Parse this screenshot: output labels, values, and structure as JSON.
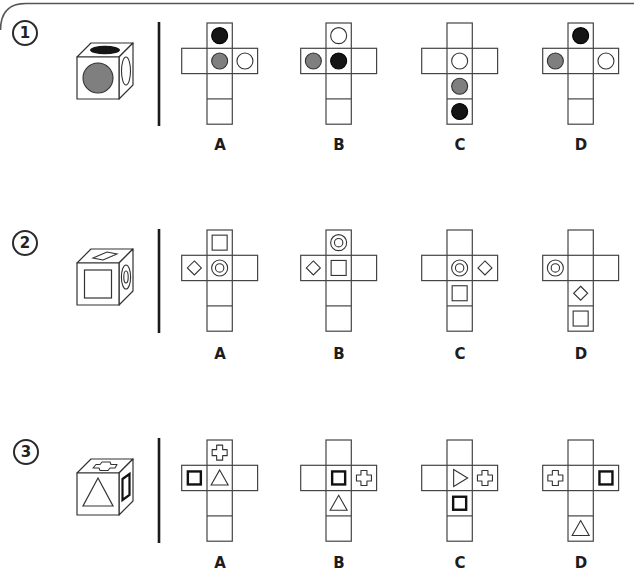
{
  "colors": {
    "line": "#444444",
    "dark": "#151515",
    "gray": "#7f7f7f",
    "border": "#555555"
  },
  "questions": [
    {
      "number": "1",
      "cube": {
        "front": "gray-circle",
        "top": "black-ellipse",
        "right": "white-ellipse"
      },
      "options": [
        {
          "label": "A",
          "faces": {
            "top": "black-circle",
            "left": "",
            "center": "gray-circle",
            "right": "white-circle",
            "below": "",
            "bottom": ""
          }
        },
        {
          "label": "B",
          "faces": {
            "top": "white-circle",
            "left": "gray-circle",
            "center": "black-circle",
            "right": "",
            "below": "",
            "bottom": ""
          }
        },
        {
          "label": "C",
          "faces": {
            "top": "",
            "left": "",
            "center": "white-circle",
            "right": "",
            "below": "gray-circle",
            "bottom": "black-circle"
          }
        },
        {
          "label": "D",
          "faces": {
            "top": "black-circle",
            "left": "gray-circle",
            "center": "",
            "right": "white-circle",
            "below": "",
            "bottom": ""
          }
        }
      ]
    },
    {
      "number": "2",
      "cube": {
        "front": "square",
        "top": "diamond",
        "right": "double-ring"
      },
      "options": [
        {
          "label": "A",
          "faces": {
            "top": "square",
            "left": "diamond",
            "center": "double-ring",
            "right": "",
            "below": "",
            "bottom": ""
          }
        },
        {
          "label": "B",
          "faces": {
            "top": "double-ring",
            "left": "diamond",
            "center": "square",
            "right": "",
            "below": "",
            "bottom": ""
          }
        },
        {
          "label": "C",
          "faces": {
            "top": "",
            "left": "",
            "center": "double-ring",
            "right": "diamond",
            "below": "square",
            "bottom": ""
          }
        },
        {
          "label": "D",
          "faces": {
            "top": "",
            "left": "double-ring",
            "center": "",
            "right": "",
            "below": "diamond",
            "bottom": "square"
          }
        }
      ]
    },
    {
      "number": "3",
      "cube": {
        "front": "triangle",
        "top": "cross",
        "right": "bold-square"
      },
      "options": [
        {
          "label": "A",
          "faces": {
            "top": "cross",
            "left": "bold-square",
            "center": "triangle",
            "right": "",
            "below": "",
            "bottom": ""
          }
        },
        {
          "label": "B",
          "faces": {
            "top": "",
            "left": "",
            "center": "bold-square",
            "right": "cross",
            "below": "triangle",
            "bottom": ""
          }
        },
        {
          "label": "C",
          "faces": {
            "top": "",
            "left": "",
            "center": "triangle-right",
            "right": "cross",
            "below": "bold-square",
            "bottom": ""
          }
        },
        {
          "label": "D",
          "faces": {
            "top": "",
            "left": "cross",
            "center": "",
            "right": "bold-square",
            "below": "",
            "bottom": "triangle"
          }
        }
      ]
    }
  ]
}
